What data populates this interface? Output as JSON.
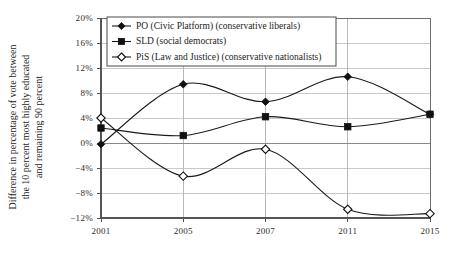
{
  "chart_data": {
    "type": "line",
    "title": "",
    "xlabel": "",
    "ylabel": "Difference in percentage of vote between the 10 percent most highly educated and remaining 90 percent",
    "ylabel_lines": [
      "Difference in percentage of vote between",
      "the 10 percent most highly educated",
      "and remaining 90 percent"
    ],
    "categories": [
      "2001",
      "2005",
      "2007",
      "2011",
      "2015"
    ],
    "x": [
      2001,
      2005,
      2007,
      2011,
      2015
    ],
    "ylim": [
      -12,
      20
    ],
    "yticks": [
      20,
      16,
      12,
      8,
      4,
      0,
      -4,
      -8,
      -12
    ],
    "ytick_labels": [
      "20%",
      "16%",
      "12%",
      "8%",
      "4%",
      "0%",
      "−4%",
      "−8%",
      "−12%"
    ],
    "xtick_labels": [
      "2001",
      "2005",
      "2007",
      "2011",
      "2015"
    ],
    "grid": true,
    "grid_axis": "both",
    "legend_position": "top-left-inside",
    "series": [
      {
        "name": "PO (Civic Platform) (conservative liberals)",
        "marker": "filled-diamond",
        "color": "#111111",
        "values": [
          -0.2,
          9.4,
          6.6,
          10.6,
          4.6
        ]
      },
      {
        "name": "SLD (social democrats)",
        "marker": "filled-square",
        "color": "#111111",
        "values": [
          2.4,
          1.2,
          4.2,
          2.6,
          4.6
        ]
      },
      {
        "name": "PiS (Law and Justice) (conservative nationalists)",
        "marker": "open-diamond",
        "color": "#111111",
        "values": [
          4.0,
          -5.3,
          -1.0,
          -10.6,
          -11.3
        ]
      }
    ]
  },
  "legend": {
    "entries": [
      {
        "label": "PO (Civic Platform) (conservative liberals)",
        "marker": "filled-diamond"
      },
      {
        "label": "SLD (social democrats)",
        "marker": "filled-square"
      },
      {
        "label": "PiS (Law and Justice) (conservative nationalists)",
        "marker": "open-diamond"
      }
    ]
  },
  "colors": {
    "background": "#ffffff",
    "ink": "#111111",
    "gridline": "#c9c9c9",
    "border": "#6e6e6e",
    "zeroline": "#8a8a8a"
  }
}
